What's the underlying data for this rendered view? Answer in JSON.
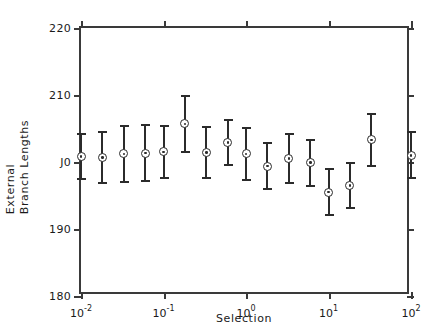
{
  "chart_data": {
    "type": "scatter",
    "title": "",
    "xlabel": "Selection",
    "ylabel": "External Branch Lengths",
    "ylabel_lines": [
      "External",
      "Branch Lengths"
    ],
    "xscale": "log",
    "yscale": "linear",
    "xlim": [
      0.01,
      100
    ],
    "ylim": [
      180,
      220
    ],
    "grid": false,
    "legend": null,
    "error_bars": "symmetric",
    "marker": "circle-with-center-dot",
    "xtick_labels": [
      "10-2",
      "10-1",
      "100",
      "101",
      "102"
    ],
    "xtick_mantissa": [
      "10",
      "10",
      "10",
      "10",
      "10"
    ],
    "xtick_exponents": [
      "-2",
      "-1",
      "0",
      "1",
      "2"
    ],
    "xtick_values": [
      0.01,
      0.1,
      1,
      10,
      100
    ],
    "ytick_labels": [
      "220",
      "210",
      "J0",
      "190",
      "180"
    ],
    "ytick_values": [
      220,
      210,
      200,
      190,
      180
    ],
    "ytick_note": "third label renders as artifacted 'J0' (degraded '200') in the source image",
    "n_points": 16,
    "x": [
      0.01,
      0.0182,
      0.0331,
      0.0603,
      0.1,
      0.182,
      0.331,
      0.603,
      1.0,
      1.82,
      3.31,
      6.03,
      10.0,
      18.2,
      33.1,
      100.0
    ],
    "y": [
      200.8,
      200.7,
      201.2,
      201.3,
      201.5,
      205.7,
      201.4,
      202.9,
      201.2,
      199.4,
      200.5,
      199.9,
      195.5,
      196.5,
      203.3,
      201.0
    ],
    "y_err_lower": [
      3.5,
      4.0,
      4.3,
      4.3,
      4.0,
      4.3,
      4.0,
      3.5,
      4.0,
      3.6,
      3.8,
      3.6,
      3.6,
      3.5,
      4.0,
      3.6
    ],
    "y_err_upper": [
      3.5,
      4.0,
      4.3,
      4.3,
      4.0,
      4.3,
      4.0,
      3.5,
      4.0,
      3.6,
      3.8,
      3.6,
      3.6,
      3.5,
      4.0,
      3.6
    ],
    "colors": {
      "marker": "#2b2b2b",
      "errorbar": "#2b2b2b",
      "axis": "#3a3a3a",
      "text": "#1a1a1a",
      "background": "#ffffff"
    }
  }
}
